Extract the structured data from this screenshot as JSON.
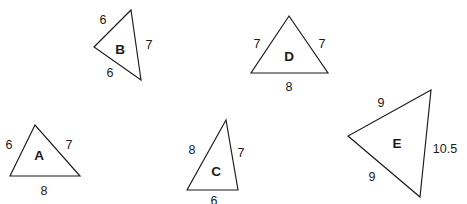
{
  "diagram": {
    "type": "geometry-figure",
    "background_color": "#ffffff",
    "stroke_color": "#1a1a1a",
    "text_color": "#1a1a1a",
    "canvas": {
      "width": 467,
      "height": 204
    },
    "triangles": [
      {
        "id": "A",
        "name": "A",
        "name_pos": {
          "x": 39,
          "y": 156
        },
        "points": "35,125 10,176 80,176",
        "sides": [
          {
            "value": "6",
            "x": 9,
            "y": 146
          },
          {
            "value": "7",
            "x": 69,
            "y": 146
          },
          {
            "value": "8",
            "x": 44,
            "y": 192
          }
        ]
      },
      {
        "id": "B",
        "name": "B",
        "name_pos": {
          "x": 120,
          "y": 50
        },
        "points": "131,10 94,47 141,80",
        "sides": [
          {
            "value": "6",
            "x": 103,
            "y": 21
          },
          {
            "value": "7",
            "x": 149,
            "y": 46
          },
          {
            "value": "6",
            "x": 110,
            "y": 74
          }
        ]
      },
      {
        "id": "C",
        "name": "C",
        "name_pos": {
          "x": 216,
          "y": 172
        },
        "points": "226,120 187,190 238,190",
        "sides": [
          {
            "value": "8",
            "x": 192,
            "y": 151
          },
          {
            "value": "7",
            "x": 241,
            "y": 154
          },
          {
            "value": "6",
            "x": 214,
            "y": 202
          }
        ]
      },
      {
        "id": "D",
        "name": "D",
        "name_pos": {
          "x": 289,
          "y": 57
        },
        "points": "289,16 251,73 328,73",
        "sides": [
          {
            "value": "7",
            "x": 257,
            "y": 45
          },
          {
            "value": "7",
            "x": 322,
            "y": 45
          },
          {
            "value": "8",
            "x": 289,
            "y": 88
          }
        ]
      },
      {
        "id": "E",
        "name": "E",
        "name_pos": {
          "x": 397,
          "y": 144
        },
        "points": "431,90 348,136 420,197",
        "sides": [
          {
            "value": "9",
            "x": 381,
            "y": 104
          },
          {
            "value": "10.5",
            "x": 445,
            "y": 150
          },
          {
            "value": "9",
            "x": 372,
            "y": 178
          }
        ]
      }
    ]
  }
}
